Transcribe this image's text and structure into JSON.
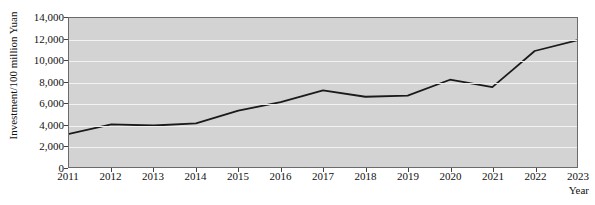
{
  "chart_data": {
    "type": "line",
    "title": "",
    "xlabel": "Year",
    "ylabel": "Investment/100 million Yuan",
    "x": [
      2011,
      2012,
      2013,
      2014,
      2015,
      2016,
      2017,
      2018,
      2019,
      2020,
      2021,
      2022,
      2023
    ],
    "categories": [
      "2011",
      "2012",
      "2013",
      "2014",
      "2015",
      "2016",
      "2017",
      "2018",
      "2019",
      "2020",
      "2021",
      "2022",
      "2023"
    ],
    "values": [
      3100,
      4000,
      3900,
      4100,
      5300,
      6100,
      7200,
      6600,
      6700,
      8200,
      7500,
      10900,
      11900
    ],
    "series": [
      {
        "name": "Investment",
        "values": [
          3100,
          4000,
          3900,
          4100,
          5300,
          6100,
          7200,
          6600,
          6700,
          8200,
          7500,
          10900,
          11900
        ]
      }
    ],
    "xlim": [
      2011,
      2023
    ],
    "ylim": [
      0,
      14000
    ],
    "ytick_values": [
      0,
      2000,
      4000,
      6000,
      8000,
      10000,
      12000,
      14000
    ],
    "ytick_labels": [
      "0",
      "2,000",
      "4,000",
      "6,000",
      "8,000",
      "10,000",
      "12,000",
      "14,000"
    ],
    "xtick_labels": [
      "2011",
      "2012",
      "2013",
      "2014",
      "2015",
      "2016",
      "2017",
      "2018",
      "2019",
      "2020",
      "2021",
      "2022",
      "2023"
    ],
    "grid": true,
    "legend": false,
    "legend_position": "none",
    "colors": {
      "plot_background": "#d3d3d3",
      "page_background": "#ffffff",
      "gridline": "#f2f2f2",
      "line": "#1a1a1a",
      "axis": "#6b6b6b",
      "text": "#111111"
    }
  }
}
